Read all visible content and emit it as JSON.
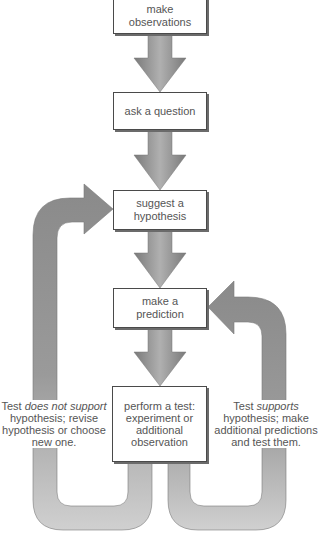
{
  "diagram": {
    "colors": {
      "arrow": "#8c8c8c",
      "arrow_light": "#bdbdbd",
      "box_border": "#4a4a4a",
      "text": "#555555"
    },
    "steps": [
      {
        "id": "observe",
        "lines": [
          "make",
          "observations"
        ]
      },
      {
        "id": "question",
        "lines": [
          "ask a question"
        ]
      },
      {
        "id": "hypothesis",
        "lines": [
          "suggest a",
          "hypothesis"
        ]
      },
      {
        "id": "prediction",
        "lines": [
          "make a",
          "prediction"
        ]
      },
      {
        "id": "test",
        "lines": [
          "perform a test:",
          "experiment or",
          "additional",
          "observation"
        ]
      }
    ],
    "feedback": {
      "not_support": {
        "prefix": "Test ",
        "emphasis": "does not support",
        "lines": [
          "hypothesis; revise",
          "hypothesis or choose",
          "new one."
        ]
      },
      "supports": {
        "prefix": "Test ",
        "emphasis": "supports",
        "lines": [
          "hypothesis; make",
          "additional predictions",
          "and test them."
        ]
      }
    }
  }
}
